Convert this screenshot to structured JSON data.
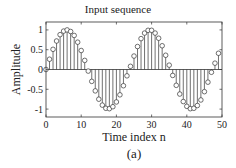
{
  "figure": {
    "title": "Input sequence",
    "xlabel": "Time index n",
    "ylabel": "Amplitude",
    "caption": "(a)"
  },
  "chart_data": {
    "type": "stem",
    "title": "Input sequence",
    "xlabel": "Time index n",
    "ylabel": "Amplitude",
    "xlim": [
      0,
      50
    ],
    "ylim": [
      -1.2,
      1.2
    ],
    "xticks": [
      0,
      10,
      20,
      30,
      40,
      50
    ],
    "yticks": [
      -1,
      -0.5,
      0,
      0.5,
      1
    ],
    "ytick_labels": [
      "-1",
      "-0.5",
      "0",
      "0.5",
      "1"
    ],
    "grid": false,
    "caption": "(a)",
    "x": [
      0,
      1,
      2,
      3,
      4,
      5,
      6,
      7,
      8,
      9,
      10,
      11,
      12,
      13,
      14,
      15,
      16,
      17,
      18,
      19,
      20,
      21,
      22,
      23,
      24,
      25,
      26,
      27,
      28,
      29,
      30,
      31,
      32,
      33,
      34,
      35,
      36,
      37,
      38,
      39,
      40,
      41,
      42,
      43,
      44,
      45,
      46,
      47,
      48,
      49
    ],
    "values": [
      0.0,
      0.26,
      0.51,
      0.72,
      0.88,
      0.97,
      1.0,
      0.96,
      0.86,
      0.69,
      0.48,
      0.23,
      -0.04,
      -0.3,
      -0.54,
      -0.75,
      -0.9,
      -0.98,
      -0.99,
      -0.94,
      -0.82,
      -0.64,
      -0.41,
      -0.16,
      0.08,
      0.34,
      0.58,
      0.78,
      0.92,
      0.99,
      0.99,
      0.92,
      0.79,
      0.6,
      0.36,
      0.11,
      -0.15,
      -0.4,
      -0.62,
      -0.81,
      -0.93,
      -0.99,
      -0.98,
      -0.91,
      -0.77,
      -0.56,
      -0.32,
      -0.07,
      0.16,
      0.41
    ]
  }
}
